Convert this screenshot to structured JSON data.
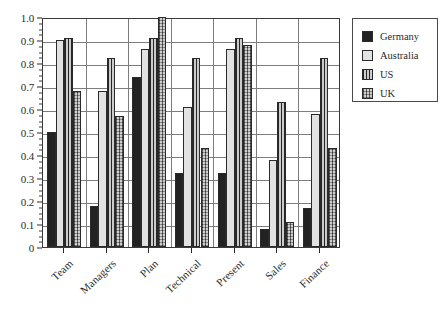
{
  "chart_data": {
    "type": "bar",
    "title": "",
    "xlabel": "",
    "ylabel": "",
    "ylim": [
      0,
      1.0
    ],
    "ytick_step": 0.1,
    "grid": true,
    "legend_position": "right-outside",
    "categories": [
      "Team",
      "Managers",
      "Plan",
      "Technical",
      "Present",
      "Sales",
      "Finance"
    ],
    "ytick_labels": [
      "1.0",
      "0.9",
      "0.8",
      "0.7",
      "0.6",
      "0.5",
      "0.4",
      "0.3",
      "0.2",
      "0.1",
      "0"
    ],
    "series": [
      {
        "name": "Germany",
        "color": "#222222",
        "pattern": "solid-dark",
        "values": [
          0.5,
          0.18,
          0.74,
          0.32,
          0.32,
          0.08,
          0.17
        ]
      },
      {
        "name": "Australia",
        "color": "#e2e2e2",
        "pattern": "solid-light",
        "values": [
          0.9,
          0.68,
          0.86,
          0.61,
          0.86,
          0.38,
          0.58
        ]
      },
      {
        "name": "US",
        "color": "#8d8d8d",
        "pattern": "vertical-stripes",
        "values": [
          0.91,
          0.82,
          0.91,
          0.82,
          0.91,
          0.63,
          0.82
        ]
      },
      {
        "name": "UK",
        "color": "#8a8a8a",
        "pattern": "cross-hatch",
        "values": [
          0.68,
          0.57,
          1.0,
          0.43,
          0.88,
          0.11,
          0.43
        ]
      }
    ]
  },
  "legend": {
    "items": [
      {
        "label": "Germany"
      },
      {
        "label": "Australia"
      },
      {
        "label": "US"
      },
      {
        "label": "UK"
      }
    ]
  }
}
